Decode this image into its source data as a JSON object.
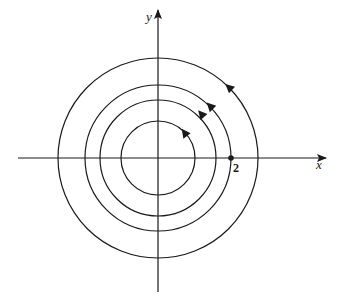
{
  "diagram": {
    "type": "phase-portrait",
    "axes": {
      "x_label": "x",
      "y_label": "y",
      "x_tick_label": "2"
    },
    "center": {
      "cx": 158,
      "cy": 158
    },
    "circles": [
      {
        "r": 37,
        "arrow": true
      },
      {
        "r": 58,
        "arrow": true
      },
      {
        "r": 73,
        "arrow": true
      },
      {
        "r": 100,
        "arrow": true
      }
    ],
    "marked_point": {
      "label": "2",
      "cx": 231,
      "cy": 158
    },
    "colors": {
      "stroke": "#1a1a1a",
      "background": "#ffffff"
    }
  }
}
